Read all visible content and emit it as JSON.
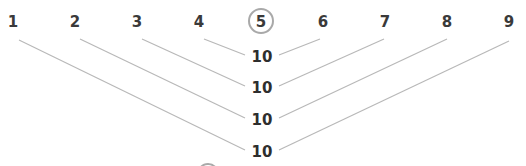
{
  "diagram": {
    "title": "",
    "top_numbers": [
      {
        "label": "1",
        "x": 13
      },
      {
        "label": "2",
        "x": 75
      },
      {
        "label": "3",
        "x": 137
      },
      {
        "label": "4",
        "x": 199
      },
      {
        "label": "5",
        "x": 261,
        "circled": true
      },
      {
        "label": "6",
        "x": 323
      },
      {
        "label": "7",
        "x": 385
      },
      {
        "label": "8",
        "x": 447
      },
      {
        "label": "9",
        "x": 509
      }
    ],
    "sums": [
      {
        "label": "10",
        "pair": [
          "4",
          "6"
        ],
        "y": 62
      },
      {
        "label": "10",
        "pair": [
          "3",
          "7"
        ],
        "y": 93
      },
      {
        "label": "10",
        "pair": [
          "2",
          "8"
        ],
        "y": 125
      },
      {
        "label": "10",
        "pair": [
          "1",
          "9"
        ],
        "y": 157
      }
    ],
    "colors": {
      "text": "#3a3a3a",
      "line": "#b8b8b8",
      "ring": "#a9a9a9",
      "background": "#ffffff"
    }
  }
}
